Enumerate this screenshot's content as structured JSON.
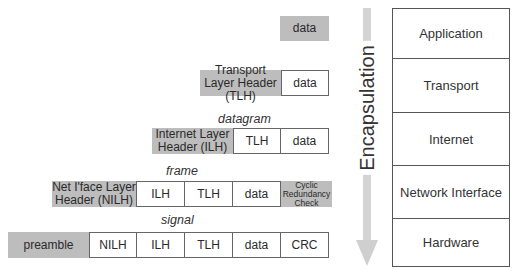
{
  "rows": {
    "application": {
      "data": "data"
    },
    "transport": {
      "header": "Transport Layer Header (TLH)",
      "data": "data"
    },
    "datagram": {
      "label": "datagram",
      "header": "Internet Layer Header (ILH)",
      "tlh": "TLH",
      "data": "data"
    },
    "frame": {
      "label": "frame",
      "header": "Net I'face Layer Header (NILH)",
      "ilh": "ILH",
      "tlh": "TLH",
      "data": "data",
      "trailer": "Cyclic Redundancy Check"
    },
    "signal": {
      "label": "signal",
      "preamble": "preamble",
      "nilh": "NILH",
      "ilh": "ILH",
      "tlh": "TLH",
      "data": "data",
      "crc": "CRC"
    }
  },
  "arrow": {
    "label": "Encapsulation"
  },
  "layers": [
    "Application",
    "Transport",
    "Internet",
    "Network Interface",
    "Hardware"
  ],
  "colors": {
    "header_fill": "#bdbdbd",
    "arrow": "#d4d4d4",
    "border": "#666666"
  }
}
